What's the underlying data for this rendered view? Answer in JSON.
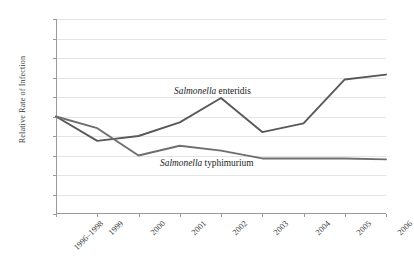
{
  "chart_data": {
    "type": "line",
    "title": "",
    "xlabel": "",
    "ylabel": "Relative Rate of Infection",
    "categories": [
      "1996–1998",
      "1999",
      "2000",
      "2001",
      "2002",
      "2003",
      "2004",
      "2005",
      "2006"
    ],
    "ylim": [
      0,
      2
    ],
    "ytick_labels": [
      "2",
      "1.8",
      "1.6",
      "1.4",
      "1.2",
      "1",
      "0.8",
      "0.6",
      "0.4",
      "0.2",
      "0"
    ],
    "ytick_values": [
      2,
      1.8,
      1.6,
      1.4,
      1.2,
      1,
      0.8,
      0.6,
      0.4,
      0.2,
      0
    ],
    "grid": true,
    "legend_position": "inline-annotation",
    "series": [
      {
        "name": "Salmonella enteridis",
        "name_italic_part": "Salmonella",
        "name_roman_part": "enteridis",
        "color": "#595959",
        "values": [
          1.0,
          0.75,
          0.8,
          0.94,
          1.19,
          0.84,
          0.93,
          1.38,
          1.43
        ]
      },
      {
        "name": "Salmonella typhimurium",
        "name_italic_part": "Salmonella",
        "name_roman_part": "typhimurium",
        "color": "#6e6e6e",
        "values": [
          1.0,
          0.88,
          0.6,
          0.7,
          0.65,
          0.57,
          0.57,
          0.57,
          0.56
        ]
      }
    ]
  }
}
